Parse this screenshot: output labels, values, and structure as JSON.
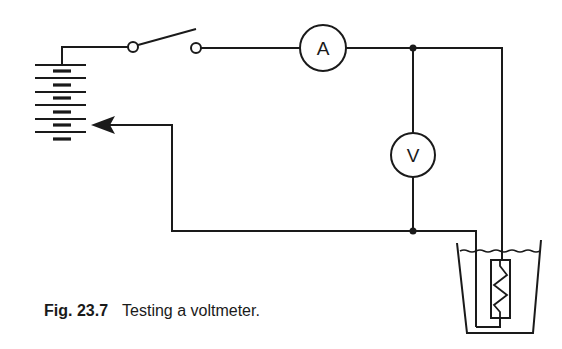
{
  "figure": {
    "caption_number": "Fig. 23.7",
    "caption_text": "Testing a voltmeter."
  },
  "components": {
    "ammeter": {
      "label": "A"
    },
    "voltmeter": {
      "label": "V"
    },
    "battery": {
      "cells": 6
    },
    "switch": {
      "state": "open"
    },
    "heater": {
      "type": "resistance coil in beaker of liquid"
    }
  },
  "colors": {
    "ink": "#1a1a1a",
    "background": "#ffffff"
  }
}
